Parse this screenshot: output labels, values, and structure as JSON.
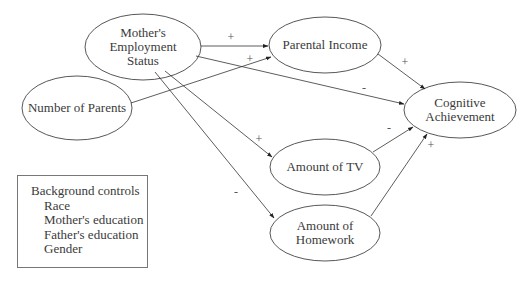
{
  "nodes": {
    "mother_employment": {
      "label": "Mother's\nEmployment\nStatus",
      "cx": 143,
      "cy": 47,
      "rx": 58,
      "ry": 33
    },
    "number_of_parents": {
      "label": "Number of Parents",
      "cx": 77,
      "cy": 108,
      "rx": 55,
      "ry": 32
    },
    "parental_income": {
      "label": "Parental Income",
      "cx": 325,
      "cy": 45,
      "rx": 56,
      "ry": 28
    },
    "cognitive_achievement": {
      "label": "Cognitive\nAchievement",
      "cx": 460,
      "cy": 110,
      "rx": 56,
      "ry": 28
    },
    "amount_of_tv": {
      "label": "Amount of TV",
      "cx": 325,
      "cy": 167,
      "rx": 55,
      "ry": 28
    },
    "amount_of_homework": {
      "label": "Amount of\nHomework",
      "cx": 325,
      "cy": 233,
      "rx": 55,
      "ry": 28
    }
  },
  "edges": [
    {
      "from": "mother_employment",
      "to": "parental_income",
      "sign": "+"
    },
    {
      "from": "number_of_parents",
      "to": "parental_income",
      "sign": "+"
    },
    {
      "from": "mother_employment",
      "to": "cognitive_achievement",
      "sign": "-"
    },
    {
      "from": "parental_income",
      "to": "cognitive_achievement",
      "sign": "+"
    },
    {
      "from": "mother_employment",
      "to": "amount_of_tv",
      "sign": "+"
    },
    {
      "from": "mother_employment",
      "to": "amount_of_homework",
      "sign": "-"
    },
    {
      "from": "amount_of_tv",
      "to": "cognitive_achievement",
      "sign": "-"
    },
    {
      "from": "amount_of_homework",
      "to": "cognitive_achievement",
      "sign": "+"
    }
  ],
  "signs": {
    "me_pi": "+",
    "np_pi": "+",
    "me_ca": "-",
    "pi_ca": "+",
    "me_tv": "+",
    "me_hw": "-",
    "tv_ca": "-",
    "hw_ca": "+"
  },
  "background_controls": {
    "title": "Background controls",
    "items": [
      "Race",
      "Mother's education",
      "Father's education",
      "Gender"
    ]
  }
}
